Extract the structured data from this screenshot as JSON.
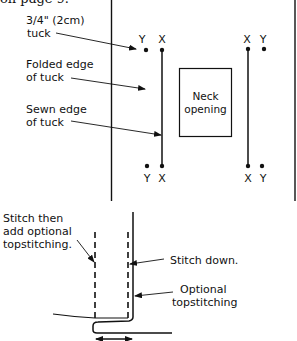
{
  "header": {
    "partial_text": "on page 9."
  },
  "tuck_diagram": {
    "labels": {
      "tuck_size": "3/4\" (2cm)",
      "tuck_size_2": "tuck",
      "folded_edge": "Folded edge",
      "folded_edge_2": "of tuck",
      "sewn_edge": "Sewn edge",
      "sewn_edge_2": "of tuck"
    },
    "markers": {
      "top_left": [
        "Y",
        "X"
      ],
      "top_right": [
        "X",
        "Y"
      ],
      "bottom_left": [
        "Y",
        "X"
      ],
      "bottom_right": [
        "X",
        "Y"
      ]
    },
    "neck_box": {
      "line1": "Neck",
      "line2": "opening"
    }
  },
  "fold_diagram": {
    "labels": {
      "stitch_then": "Stitch then",
      "add_optional": "add optional",
      "topstitching_dot": "topstitching.",
      "stitch_down": "Stitch down.",
      "optional": "Optional",
      "topstitching": "topstitching"
    }
  },
  "colors": {
    "ink": "#111111",
    "background": "#ffffff"
  }
}
